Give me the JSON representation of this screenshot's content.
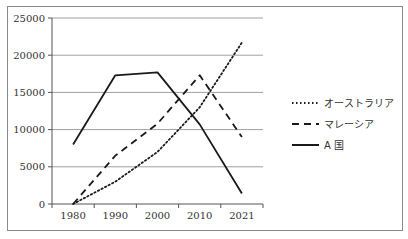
{
  "chart_data": {
    "type": "line",
    "title": "",
    "xlabel": "",
    "ylabel": "",
    "categories": [
      "1980",
      "1990",
      "2000",
      "2010",
      "2021"
    ],
    "ylim": [
      0,
      25000
    ],
    "yticks": [
      0,
      5000,
      10000,
      15000,
      20000,
      25000
    ],
    "grid": true,
    "legend_position": "right",
    "series": [
      {
        "name": "オーストラリア",
        "style": "dotted",
        "values": [
          0,
          3000,
          7000,
          13000,
          21700
        ]
      },
      {
        "name": "マレーシア",
        "style": "dashed",
        "values": [
          0,
          6500,
          10800,
          17300,
          9000
        ]
      },
      {
        "name": "A 国",
        "style": "solid",
        "values": [
          8000,
          17300,
          17700,
          10700,
          1400
        ]
      }
    ]
  },
  "colors": {
    "line": "#1a1a1a",
    "grid": "#a0a0a0",
    "axis": "#555555"
  }
}
